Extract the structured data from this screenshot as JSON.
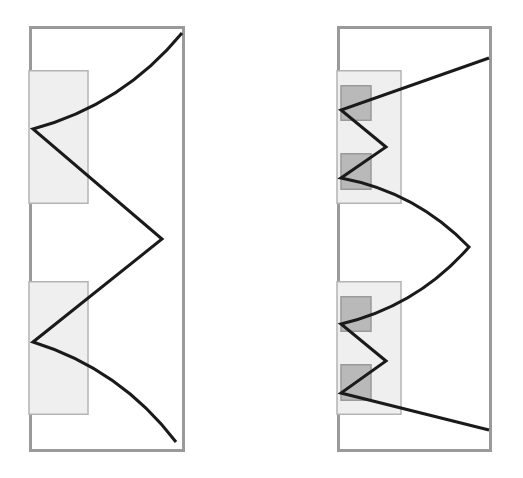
{
  "figure": {
    "width": 523,
    "height": 478,
    "background_color": "#ffffff",
    "panel_count": 2,
    "caption": ""
  },
  "colors": {
    "background": "#ffffff",
    "panel_border": "#9a9a9a",
    "panel_fill": "#ffffff",
    "light_box_fill": "#efefef",
    "light_box_border": "#b4b4b4",
    "dark_box_fill": "#b9b9b9",
    "dark_box_border": "#9a9a9a",
    "curve_stroke": "#1a1a1a"
  },
  "strokes": {
    "panel_border_width": 3,
    "light_box_border_width": 1.5,
    "dark_box_border_width": 1.5,
    "curve_width": 3
  },
  "panels": [
    {
      "id": "left-panel",
      "name": "smooth-curve-panel",
      "label": "",
      "frame": {
        "x": 29,
        "y": 26,
        "width": 156,
        "height": 426
      },
      "light_boxes": [
        {
          "name": "upper-region-box",
          "x": 29,
          "y": 70,
          "width": 59,
          "height": 134
        },
        {
          "name": "lower-region-box",
          "x": 29,
          "y": 281,
          "width": 59,
          "height": 134
        }
      ],
      "dark_boxes": [],
      "curve": {
        "name": "zigzag-curve",
        "type": "polyline-with-bezier",
        "vertices": [
          {
            "x": 182,
            "y": 33
          },
          {
            "x": 33,
            "y": 129
          },
          {
            "x": 162,
            "y": 239
          },
          {
            "x": 33,
            "y": 342
          },
          {
            "x": 176,
            "y": 442
          }
        ],
        "segment_style": [
          "curved",
          "straight",
          "straight",
          "curved"
        ]
      }
    },
    {
      "id": "right-panel",
      "name": "oscillating-curve-panel",
      "label": "",
      "frame": {
        "x": 337,
        "y": 26,
        "width": 155,
        "height": 426
      },
      "light_boxes": [
        {
          "name": "upper-region-box",
          "x": 337,
          "y": 70,
          "width": 64,
          "height": 134
        },
        {
          "name": "lower-region-box",
          "x": 337,
          "y": 281,
          "width": 64,
          "height": 134
        }
      ],
      "dark_boxes": [
        {
          "name": "upper-subregion-box-a",
          "x": 341,
          "y": 85,
          "width": 30,
          "height": 36
        },
        {
          "name": "upper-subregion-box-b",
          "x": 341,
          "y": 153,
          "width": 30,
          "height": 37
        },
        {
          "name": "lower-subregion-box-a",
          "x": 341,
          "y": 296,
          "width": 30,
          "height": 36
        },
        {
          "name": "lower-subregion-box-b",
          "x": 341,
          "y": 364,
          "width": 30,
          "height": 37
        }
      ],
      "curve": {
        "name": "oscillating-zigzag-curve",
        "type": "polyline-with-bezier",
        "vertices": [
          {
            "x": 489,
            "y": 58
          },
          {
            "x": 341,
            "y": 110
          },
          {
            "x": 386,
            "y": 147
          },
          {
            "x": 341,
            "y": 178
          },
          {
            "x": 469,
            "y": 247
          },
          {
            "x": 341,
            "y": 324
          },
          {
            "x": 386,
            "y": 361
          },
          {
            "x": 341,
            "y": 393
          },
          {
            "x": 489,
            "y": 430
          }
        ],
        "segment_style": [
          "straight",
          "straight",
          "straight",
          "curved",
          "curved",
          "straight",
          "straight",
          "straight"
        ]
      }
    }
  ]
}
